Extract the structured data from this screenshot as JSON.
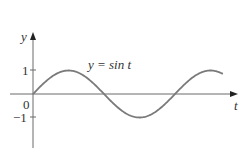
{
  "chart_data": {
    "type": "line",
    "title": "",
    "annotation": "y = sin t",
    "xlabel": "t",
    "ylabel": "y",
    "y_ticks": [
      {
        "value": 1,
        "label": "1"
      },
      {
        "value": -1,
        "label": "−1"
      }
    ],
    "origin_label": "0",
    "xlim": [
      0,
      7.0
    ],
    "ylim": [
      -1,
      1
    ],
    "grid": false,
    "legend": "none",
    "series": [
      {
        "name": "y = sin t",
        "function": "sin(t)",
        "t_range": [
          0,
          8.4
        ],
        "x": [
          0,
          1.5708,
          3.1416,
          4.7124,
          6.2832,
          7.854,
          8.4
        ],
        "values": [
          0,
          1,
          0,
          -1,
          0,
          1,
          0.85
        ]
      }
    ],
    "colors": {
      "curve": "#7a7a7a",
      "axes": "#6a6a6a",
      "text": "#333333"
    }
  }
}
